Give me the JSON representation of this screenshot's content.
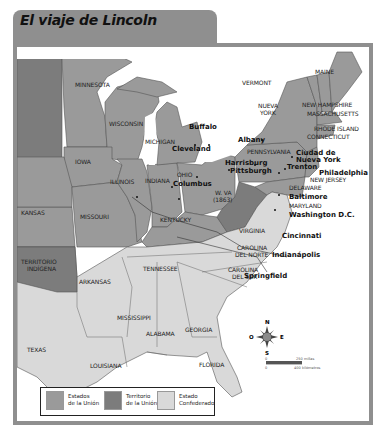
{
  "header": {
    "title": "El viaje de Lincoln"
  },
  "colors": {
    "frame": "#8f8f8f",
    "union": "#9a9a9a",
    "territory": "#7c7c7c",
    "confederate": "#d9d9d9",
    "water": "#ffffff",
    "border": "#555555"
  },
  "states": {
    "minnesota": "MINNESOTA",
    "wisconsin": "WISCONSIN",
    "michigan": "MICHIGAN",
    "iowa": "IOWA",
    "illinois": "ILLINOIS",
    "indiana": "INDIANA",
    "ohio": "OHIO",
    "kansas": "KANSAS",
    "missouri": "MISSOURI",
    "kentucky": "KENTUCKY",
    "wva_1": "W. VA",
    "wva_2": "(1863)",
    "indian_territory_1": "TERRITORIO",
    "indian_territory_2": "INDÍGENA",
    "arkansas": "ARKANSAS",
    "tennessee": "TENNESSEE",
    "virginia": "VIRGINIA",
    "nc_1": "CAROLINA",
    "nc_2": "DEL NORTE",
    "sc_1": "CAROLINA",
    "sc_2": "DEL SUR",
    "mississippi": "MISSISSIPPI",
    "alabama": "ALABAMA",
    "georgia": "GEORGIA",
    "texas": "TEXAS",
    "louisiana": "LOUISIANA",
    "florida": "FLORIDA",
    "vermont": "VERMONT",
    "maine": "MAINE",
    "ny_1": "NUEVA",
    "ny_2": "YORK",
    "new_hampshire": "NEW HAMPSHIRE",
    "massachusetts": "MASSACHUSETTS",
    "rhode_island": "RHODE ISLAND",
    "connecticut": "CONNECTICUT",
    "pennsylvania": "PENNSYLVANIA",
    "new_jersey": "NEW JERSEY",
    "delaware": "DELAWARE",
    "maryland": "MARYLAND"
  },
  "cities": {
    "buffalo": "Buffalo",
    "albany": "Albany",
    "cleveland": "Cleveland",
    "columbus": "Columbus",
    "harrisburg": "Harrisburg",
    "pittsburgh": "Pittsburgh",
    "nyc_1": "Ciudad de",
    "nyc_2": "Nueva York",
    "trenton": "Trenton",
    "philadelphia": "Philadelphia",
    "baltimore": "Baltimore",
    "washington": "Washington D.C.",
    "cincinnati": "Cincinnati",
    "indianapolis": "Indianápolis",
    "springfield": "Springfield"
  },
  "compass": {
    "n": "N",
    "s": "S",
    "e": "E",
    "w": "O"
  },
  "scale": {
    "zero_top": "0",
    "miles_value": "250",
    "miles_unit": "millas",
    "zero_bottom": "0",
    "km_value": "400",
    "km_unit": "kilómetros"
  },
  "legend": {
    "items": [
      {
        "label": "Estados\nde la Unión",
        "color": "#9a9a9a"
      },
      {
        "label": "Territorio\nde la Unión",
        "color": "#7c7c7c"
      },
      {
        "label": "Estado\nConfederado",
        "color": "#d9d9d9"
      }
    ]
  }
}
